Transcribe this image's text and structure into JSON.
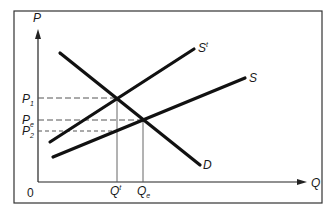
{
  "diagram": {
    "axes": {
      "y_label": "P",
      "x_label": "Q",
      "origin_label": "0"
    },
    "curves": [
      {
        "id": "demand",
        "label": "D",
        "label_sup": ""
      },
      {
        "id": "supply",
        "label": "S",
        "label_sup": ""
      },
      {
        "id": "supply_tax",
        "label": "S",
        "label_sup": "t"
      }
    ],
    "price_labels": [
      {
        "id": "p1",
        "base": "P",
        "sub": "1"
      },
      {
        "id": "pe",
        "base": "P",
        "sub": "e"
      },
      {
        "id": "p2",
        "base": "P",
        "sub": "2"
      }
    ],
    "quantity_labels": [
      {
        "id": "qt",
        "base": "Q",
        "sup": "t",
        "sub": ""
      },
      {
        "id": "qe",
        "base": "Q",
        "sup": "",
        "sub": "e"
      }
    ],
    "colors": {
      "line": "#111111",
      "frame": "#333333",
      "guide": "#555555"
    }
  }
}
